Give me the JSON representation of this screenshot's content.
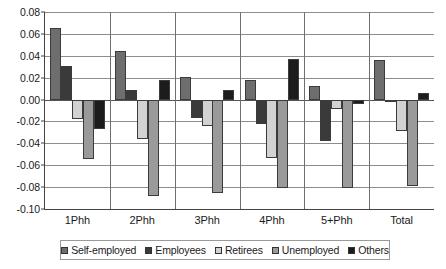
{
  "chart_data": {
    "type": "bar",
    "title": "",
    "subtitle": "",
    "xlabel": "",
    "ylabel": "",
    "categories": [
      "1Phh",
      "2Phh",
      "3Phh",
      "4Phh",
      "5+Phh",
      "Total"
    ],
    "series": [
      {
        "name": "Self-employed",
        "color": "#6e6e6e",
        "values": [
          0.065,
          0.044,
          0.021,
          0.018,
          0.012,
          0.036
        ]
      },
      {
        "name": "Employees",
        "color": "#3a3a3a",
        "values": [
          0.031,
          0.009,
          -0.017,
          -0.022,
          -0.038,
          -0.002
        ]
      },
      {
        "name": "Retirees",
        "color": "#d2d2d2",
        "values": [
          -0.018,
          -0.036,
          -0.024,
          -0.053,
          -0.009,
          -0.029
        ]
      },
      {
        "name": "Unemployed",
        "color": "#9a9a9a",
        "values": [
          -0.054,
          -0.088,
          -0.085,
          -0.081,
          -0.081,
          -0.079
        ]
      },
      {
        "name": "Others",
        "color": "#1c1c1c",
        "values": [
          -0.027,
          0.018,
          0.009,
          0.037,
          -0.004,
          0.006
        ]
      }
    ],
    "ylim": [
      -0.1,
      0.08
    ],
    "ytick_values": [
      0.08,
      0.06,
      0.04,
      0.02,
      0.0,
      -0.02,
      -0.04,
      -0.06,
      -0.08,
      -0.1
    ],
    "ytick_labels": [
      "0.08",
      "0.06",
      "0.04",
      "0.02",
      "0.00",
      "-0.02",
      "-0.04",
      "-0.06",
      "-0.08",
      "-0.10"
    ],
    "grid": true,
    "legend_position": "bottom",
    "legend_entries": [
      "Self-employed",
      "Employees",
      "Retirees",
      "Unemployed",
      "Others"
    ]
  }
}
